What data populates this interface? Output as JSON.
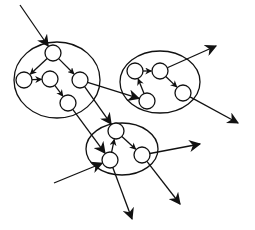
{
  "diagram": {
    "type": "clustered-directed-graph",
    "stroke_color": "#111111",
    "background": "#ffffff",
    "clusters": [
      {
        "id": "A",
        "cx": 57,
        "cy": 80,
        "rx": 43,
        "ry": 38
      },
      {
        "id": "B",
        "cx": 160,
        "cy": 82,
        "rx": 40,
        "ry": 31
      },
      {
        "id": "C",
        "cx": 122,
        "cy": 149,
        "rx": 36,
        "ry": 26
      }
    ],
    "nodes": [
      {
        "id": "a1",
        "cluster": "A",
        "x": 53,
        "y": 53,
        "r": 8
      },
      {
        "id": "a2",
        "cluster": "A",
        "x": 24,
        "y": 80,
        "r": 8
      },
      {
        "id": "a3",
        "cluster": "A",
        "x": 50,
        "y": 79,
        "r": 8
      },
      {
        "id": "a4",
        "cluster": "A",
        "x": 80,
        "y": 80,
        "r": 8
      },
      {
        "id": "a5",
        "cluster": "A",
        "x": 68,
        "y": 103,
        "r": 8
      },
      {
        "id": "b1",
        "cluster": "B",
        "x": 135,
        "y": 71,
        "r": 8
      },
      {
        "id": "b2",
        "cluster": "B",
        "x": 160,
        "y": 71,
        "r": 8
      },
      {
        "id": "b3",
        "cluster": "B",
        "x": 183,
        "y": 93,
        "r": 8
      },
      {
        "id": "b4",
        "cluster": "B",
        "x": 147,
        "y": 101,
        "r": 8
      },
      {
        "id": "c1",
        "cluster": "C",
        "x": 116,
        "y": 131,
        "r": 8
      },
      {
        "id": "c2",
        "cluster": "C",
        "x": 142,
        "y": 155,
        "r": 8
      },
      {
        "id": "c3",
        "cluster": "C",
        "x": 110,
        "y": 160,
        "r": 8
      }
    ],
    "edges": [
      {
        "from": "a1",
        "to": "a2"
      },
      {
        "from": "a1",
        "to": "a4"
      },
      {
        "from": "a2",
        "to": "a3"
      },
      {
        "from": "a3",
        "to": "a5"
      },
      {
        "from": "b1",
        "to": "b2"
      },
      {
        "from": "b2",
        "to": "b3"
      },
      {
        "from": "b4",
        "to": "b1"
      },
      {
        "from": "c1",
        "to": "c2"
      },
      {
        "from": "c3",
        "to": "c1"
      },
      {
        "from": "a4",
        "to": "b4"
      },
      {
        "from": "a4",
        "to": "c1"
      },
      {
        "from": "a5",
        "to": "c3"
      }
    ],
    "external_edges": [
      {
        "from_point": [
          20,
          5
        ],
        "to": "a1"
      },
      {
        "from": "b2",
        "to_point": [
          216,
          46
        ]
      },
      {
        "from": "b3",
        "to_point": [
          238,
          123
        ]
      },
      {
        "from_point": [
          54,
          183
        ],
        "to": "c3"
      },
      {
        "from": "c2",
        "to_point": [
          200,
          144
        ]
      },
      {
        "from": "c2",
        "to_point": [
          180,
          204
        ]
      },
      {
        "from": "c3",
        "to_point": [
          132,
          219
        ]
      }
    ]
  }
}
